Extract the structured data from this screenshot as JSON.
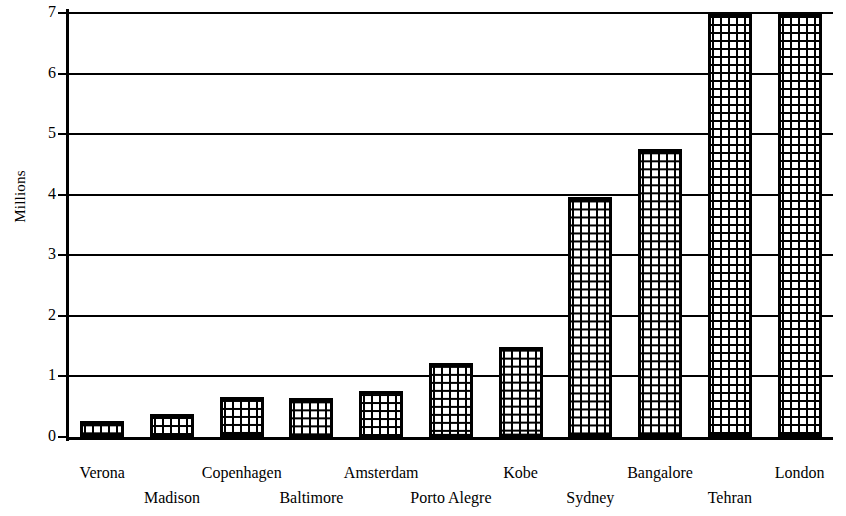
{
  "chart_data": {
    "type": "bar",
    "title": "",
    "xlabel": "",
    "ylabel": "Millions",
    "ylim": [
      0,
      7
    ],
    "yticks": [
      0,
      1,
      2,
      3,
      4,
      5,
      6,
      7
    ],
    "ytick_labels": [
      "0",
      "1",
      "2",
      "3",
      "4",
      "5",
      "6",
      "7"
    ],
    "grid": true,
    "legend": "none",
    "categories": [
      "Verona",
      "Madison",
      "Copenhagen",
      "Baltimore",
      "Amsterdam",
      "Porto Alegre",
      "Kobe",
      "Sydney",
      "Bangalore",
      "Tehran",
      "London"
    ],
    "values": [
      0.27,
      0.38,
      0.66,
      0.65,
      0.76,
      1.22,
      1.48,
      3.97,
      4.76,
      7.0,
      7.0
    ],
    "clipped_at_top": [
      "Tehran",
      "London"
    ],
    "bar_fill": "crosshatch-grid",
    "colors": {
      "bar_outline": "#000000",
      "bar_fill": "#000000",
      "bar_background": "#ffffff",
      "axis": "#000000",
      "gridline": "#000000",
      "page_background": "#ffffff",
      "text": "#000000"
    }
  },
  "axis": {
    "y_title": "Millions"
  },
  "label_rows": [
    "top",
    "bottom",
    "top",
    "bottom",
    "top",
    "bottom",
    "top",
    "bottom",
    "top",
    "bottom",
    "top"
  ]
}
